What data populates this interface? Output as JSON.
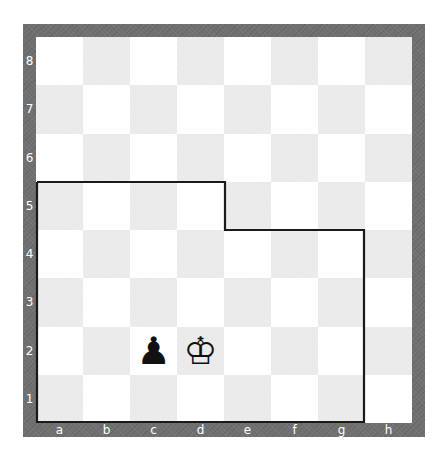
{
  "board": {
    "orientation": "white-bottom",
    "colors": {
      "frame": "#6f6f6f",
      "light_square": "#ffffff",
      "dark_square": "#ececec",
      "outline": "#1a1a1a",
      "label": "#ffffff"
    },
    "ranks": [
      "8",
      "7",
      "6",
      "5",
      "4",
      "3",
      "2",
      "1"
    ],
    "files": [
      "a",
      "b",
      "c",
      "d",
      "e",
      "f",
      "g",
      "h"
    ],
    "pieces": [
      {
        "square": "c2",
        "piece": "black-pawn",
        "glyph": "♟"
      },
      {
        "square": "d2",
        "piece": "white-king",
        "glyph": "♔"
      }
    ],
    "highlighted_region": {
      "description": "outlined area covering a1-e5 and f1-g4",
      "squares": [
        "a1",
        "b1",
        "c1",
        "d1",
        "e1",
        "f1",
        "g1",
        "a2",
        "b2",
        "c2",
        "d2",
        "e2",
        "f2",
        "g2",
        "a3",
        "b3",
        "c3",
        "d3",
        "e3",
        "f3",
        "g3",
        "a4",
        "b4",
        "c4",
        "d4",
        "e4",
        "f4",
        "g4",
        "a5",
        "b5",
        "c5",
        "d5"
      ]
    }
  }
}
